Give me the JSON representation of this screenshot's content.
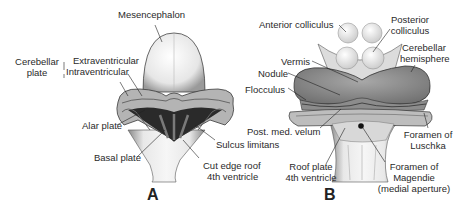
{
  "panel_a": {
    "letter": "A",
    "labels": {
      "mesencephalon": "Mesencephalon",
      "cerebellar_plate_1": "Cerebellar",
      "cerebellar_plate_2": "plate",
      "extraventricular": "Extraventricular",
      "intraventricular": "Intraventricular",
      "alar_plate": "Alar plate",
      "basal_plate": "Basal plate",
      "sulcus_limitans": "Sulcus limitans",
      "cut_edge_1": "Cut edge roof",
      "cut_edge_2": "4th ventricle"
    }
  },
  "panel_b": {
    "letter": "B",
    "labels": {
      "anterior_colliculus": "Anterior colliculus",
      "posterior_colliculus_1": "Posterior",
      "posterior_colliculus_2": "colliculus",
      "cerebellar_hemisphere_1": "Cerebellar",
      "cerebellar_hemisphere_2": "hemisphere",
      "vermis": "Vermis",
      "nodule": "Nodule",
      "flocculus": "Flocculus",
      "post_med_velum": "Post. med. velum",
      "foramen_luschka_1": "Foramen of",
      "foramen_luschka_2": "Luschka",
      "roof_plate_1": "Roof plate",
      "roof_plate_2": "4th ventricle",
      "foramen_magendie_1": "Foramen of",
      "foramen_magendie_2": "Magendie",
      "foramen_magendie_3": "(medial aperture)"
    }
  }
}
